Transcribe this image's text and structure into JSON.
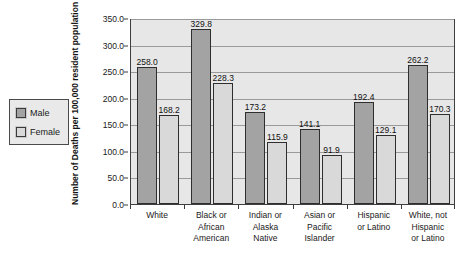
{
  "chart_data": {
    "type": "bar",
    "title": "",
    "xlabel": "",
    "ylabel": "Number of Deaths per 100,000 resident population",
    "ylim": [
      0,
      350
    ],
    "ytick_step": 50,
    "ytick_labels": [
      "0.0",
      "50.0",
      "100.0",
      "150.0",
      "200.0",
      "250.0",
      "300.0",
      "350.0"
    ],
    "grid": true,
    "legend_position": "outside-left",
    "categories": [
      "White",
      "Black or\nAfrican\nAmerican",
      "Indian or\nAlaska\nNative",
      "Asian or\nPacific\nIslander",
      "Hispanic\nor Latino",
      "White, not\nHispanic\nor Latino"
    ],
    "series": [
      {
        "name": "Male",
        "color": "#a3a3a3",
        "values": [
          258.0,
          329.8,
          173.2,
          141.1,
          192.4,
          262.2
        ],
        "labels": [
          "258.0",
          "329.8",
          "173.2",
          "141.1",
          "192.4",
          "262.2"
        ]
      },
      {
        "name": "Female",
        "color": "#d9d9d9",
        "values": [
          168.2,
          228.3,
          115.9,
          91.9,
          129.1,
          170.3
        ],
        "labels": [
          "168.2",
          "228.3",
          "115.9",
          "91.9",
          "129.1",
          "170.3"
        ]
      }
    ]
  },
  "legend": {
    "items": [
      {
        "label": "Male",
        "color": "#a3a3a3"
      },
      {
        "label": "Female",
        "color": "#d9d9d9"
      }
    ]
  },
  "colors": {
    "plot_background": "#e7e7e7",
    "gridline": "#9a9a9a",
    "axis": "#3f3f3f",
    "male_bar": "#a3a3a3",
    "female_bar": "#d9d9d9",
    "bar_outline": "#2e2e2e",
    "text": "#1a1a1a"
  }
}
